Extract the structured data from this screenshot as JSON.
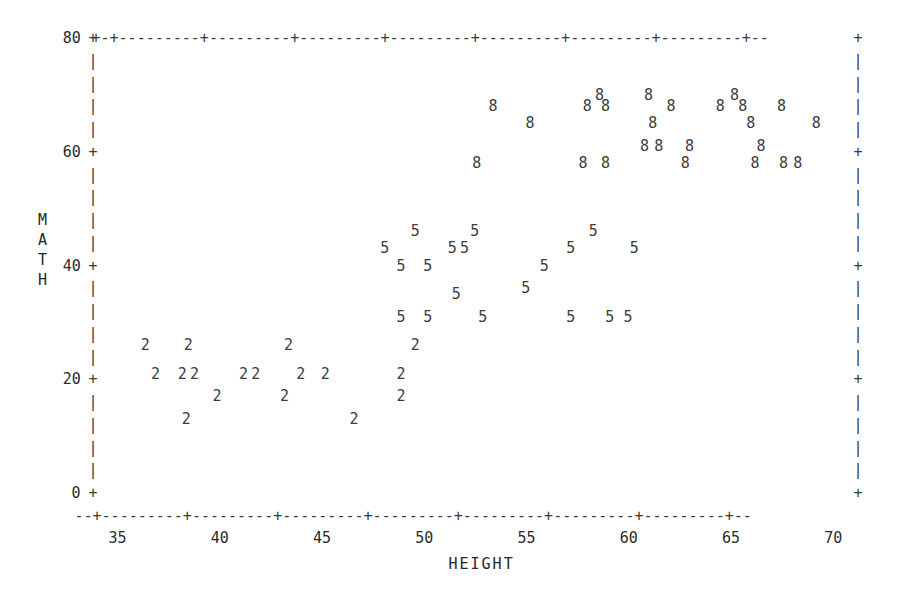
{
  "chart_data": {
    "type": "scatter",
    "title": "",
    "xlabel": "HEIGHT",
    "ylabel": "MATH",
    "xlim": [
      33.8,
      71.2
    ],
    "ylim": [
      0,
      80
    ],
    "xticks": [
      35,
      40,
      45,
      50,
      55,
      60,
      65,
      70
    ],
    "yticks": [
      0,
      20,
      40,
      60,
      80
    ],
    "grid": false,
    "legend": null,
    "plot_style": "ascii-character-plot",
    "symbol_meaning": "plotting character encodes group: 2, 5, 8",
    "series": [
      {
        "name": "2",
        "symbol": "2",
        "points": [
          [
            36.4,
            26
          ],
          [
            38.5,
            26
          ],
          [
            36.9,
            21
          ],
          [
            38.2,
            21
          ],
          [
            38.8,
            21
          ],
          [
            41.2,
            21
          ],
          [
            41.8,
            21
          ],
          [
            43.4,
            26
          ],
          [
            44.0,
            21
          ],
          [
            45.2,
            21
          ],
          [
            39.9,
            17
          ],
          [
            43.2,
            17
          ],
          [
            38.4,
            13
          ],
          [
            46.6,
            13
          ],
          [
            49.6,
            26
          ],
          [
            48.9,
            21
          ],
          [
            48.9,
            17
          ]
        ]
      },
      {
        "name": "5",
        "symbol": "5",
        "points": [
          [
            49.6,
            46
          ],
          [
            52.5,
            46
          ],
          [
            48.1,
            43
          ],
          [
            51.4,
            43
          ],
          [
            52.0,
            43
          ],
          [
            48.9,
            40
          ],
          [
            50.2,
            40
          ],
          [
            51.6,
            35
          ],
          [
            48.9,
            31
          ],
          [
            50.2,
            31
          ],
          [
            52.9,
            31
          ],
          [
            58.3,
            46
          ],
          [
            57.2,
            43
          ],
          [
            60.3,
            43
          ],
          [
            55.9,
            40
          ],
          [
            55.0,
            36
          ],
          [
            57.2,
            31
          ],
          [
            59.1,
            31
          ],
          [
            60.0,
            31
          ]
        ]
      },
      {
        "name": "8",
        "symbol": "8",
        "points": [
          [
            53.4,
            68
          ],
          [
            58.6,
            70
          ],
          [
            61.0,
            70
          ],
          [
            65.2,
            70
          ],
          [
            58.0,
            68
          ],
          [
            58.9,
            68
          ],
          [
            62.1,
            68
          ],
          [
            64.5,
            68
          ],
          [
            65.6,
            68
          ],
          [
            67.5,
            68
          ],
          [
            55.2,
            65
          ],
          [
            61.2,
            65
          ],
          [
            66.0,
            65
          ],
          [
            69.2,
            65
          ],
          [
            60.8,
            61
          ],
          [
            61.5,
            61
          ],
          [
            63.0,
            61
          ],
          [
            66.5,
            61
          ],
          [
            52.6,
            58
          ],
          [
            57.8,
            58
          ],
          [
            58.9,
            58
          ],
          [
            62.8,
            58
          ],
          [
            66.2,
            58
          ],
          [
            67.6,
            58
          ],
          [
            68.3,
            58
          ]
        ]
      }
    ]
  },
  "axes": {
    "y_axis_label_chars": [
      "M",
      "A",
      "T",
      "H"
    ],
    "y_tick_labels": [
      "80",
      "60",
      "40",
      "20",
      "0"
    ],
    "x_tick_labels": [
      "35",
      "40",
      "45",
      "50",
      "55",
      "60",
      "65",
      "70"
    ],
    "x_axis_title": "HEIGHT",
    "tick_glyph": "+",
    "horizontal_rule_glyph": "-",
    "vertical_rule_glyph": "|",
    "top_rule": "+-+---------+---------+---------+---------+---------+---------+---------+--",
    "bottom_rule": "--+---------+---------+---------+---------+---------+---------+---------+--"
  },
  "style": {
    "ink": "#2b2b2b",
    "rule_ink": "#3a3a3a",
    "background": "#ffffff"
  }
}
